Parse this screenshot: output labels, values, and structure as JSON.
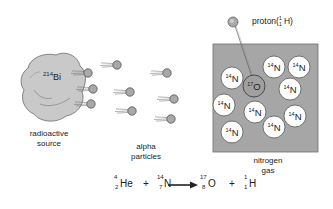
{
  "diagram": {
    "source": {
      "label_isotope": "214",
      "label_element": "Bi",
      "caption_line1": "radioactive",
      "caption_line2": "source",
      "color": "#c9c9c9"
    },
    "alpha_particles": {
      "caption_line1": "alpha",
      "caption_line2": "particles",
      "count": 9,
      "color": "#a9a9a9",
      "positions": [
        [
          88,
          73
        ],
        [
          93,
          89
        ],
        [
          91,
          104
        ],
        [
          117,
          65
        ],
        [
          130,
          92
        ],
        [
          132,
          111
        ],
        [
          167,
          73
        ],
        [
          174,
          99
        ],
        [
          171,
          119
        ]
      ]
    },
    "gas_chamber": {
      "caption_line1": "nitrogen",
      "caption_line2": "gas",
      "fill_color": "#a6a6a6",
      "nitrogen_label_mass": "14",
      "nitrogen_label_element": "N",
      "nitrogen_positions": [
        [
          232,
          78
        ],
        [
          274,
          67
        ],
        [
          299,
          67
        ],
        [
          290,
          89
        ],
        [
          224,
          105
        ],
        [
          255,
          112
        ],
        [
          295,
          116
        ],
        [
          274,
          127
        ],
        [
          232,
          132
        ]
      ],
      "oxygen_label_mass": "17",
      "oxygen_label_element": "O",
      "oxygen_position": [
        254,
        86
      ]
    },
    "proton": {
      "label": "proton(",
      "mass": "1",
      "atomic": "1",
      "element": "H",
      "close": ")",
      "position": [
        233,
        22
      ]
    },
    "equation": {
      "terms": [
        {
          "mass": "4",
          "atomic": "2",
          "symbol": "He"
        },
        {
          "operator": "+"
        },
        {
          "mass": "14",
          "atomic": "7",
          "symbol": "N"
        },
        {
          "arrow": "→"
        },
        {
          "mass": "17",
          "atomic": "8",
          "symbol": "O"
        },
        {
          "operator": "+"
        },
        {
          "mass": "1",
          "atomic": "1",
          "symbol": "H"
        }
      ],
      "he_mass": "4",
      "he_atomic": "2",
      "he_symbol": "He",
      "plus1": "+",
      "n_mass": "14",
      "n_atomic": "7",
      "n_symbol": "N",
      "o_mass": "17",
      "o_atomic": "8",
      "o_symbol": "O",
      "plus2": "+",
      "h_mass": "1",
      "h_atomic": "1",
      "h_symbol": "H"
    }
  }
}
